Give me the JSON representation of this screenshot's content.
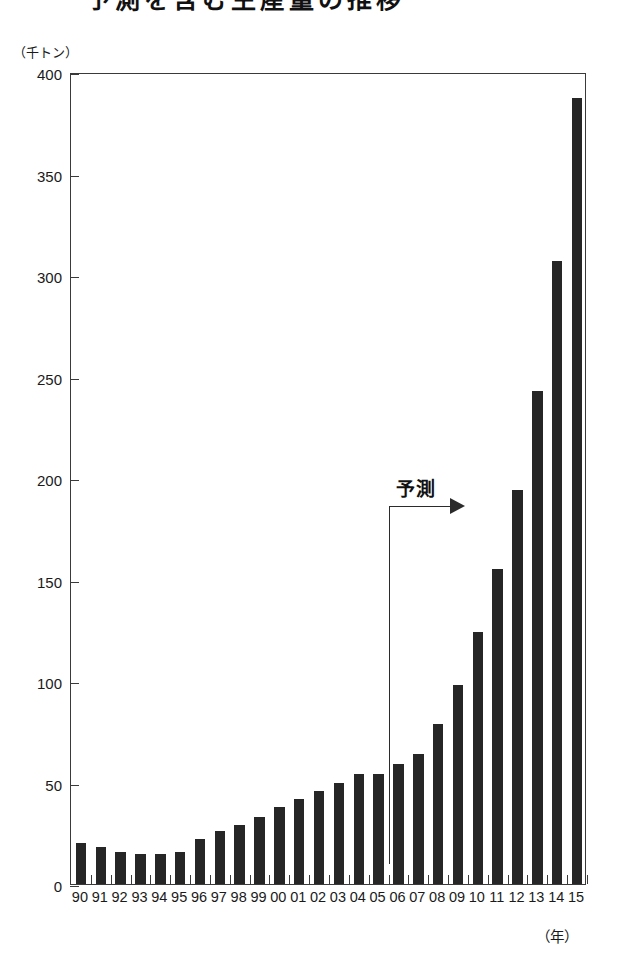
{
  "title": {
    "text": "予測を含む生産量の推移",
    "cropped": true
  },
  "chart_data": {
    "type": "bar",
    "title": "予測を含む生産量の推移",
    "xlabel": "（年）",
    "ylabel": "（千トン）",
    "ylim": [
      0,
      400
    ],
    "yticks": [
      0,
      50,
      100,
      150,
      200,
      250,
      300,
      350,
      400
    ],
    "ytick_labels": [
      "0",
      "50",
      "100",
      "150",
      "200",
      "250",
      "300",
      "350",
      "400"
    ],
    "grid": false,
    "legend": null,
    "bar_color": "#262626",
    "categories": [
      "90",
      "91",
      "92",
      "93",
      "94",
      "95",
      "96",
      "97",
      "98",
      "99",
      "00",
      "01",
      "02",
      "03",
      "04",
      "05",
      "06",
      "07",
      "08",
      "09",
      "10",
      "11",
      "12",
      "13",
      "14",
      "15"
    ],
    "values": [
      20,
      18,
      16,
      15,
      15,
      16,
      22,
      26,
      29,
      33,
      38,
      42,
      46,
      50,
      54,
      54,
      59,
      64,
      79,
      98,
      124,
      155,
      194,
      243,
      307,
      387
    ],
    "annotations": [
      {
        "name": "forecast-bracket",
        "label": "予測",
        "starts_at_category": "06",
        "direction": "right"
      }
    ]
  },
  "axes": {
    "y_unit": "（千トン）",
    "x_unit": "（年）"
  }
}
